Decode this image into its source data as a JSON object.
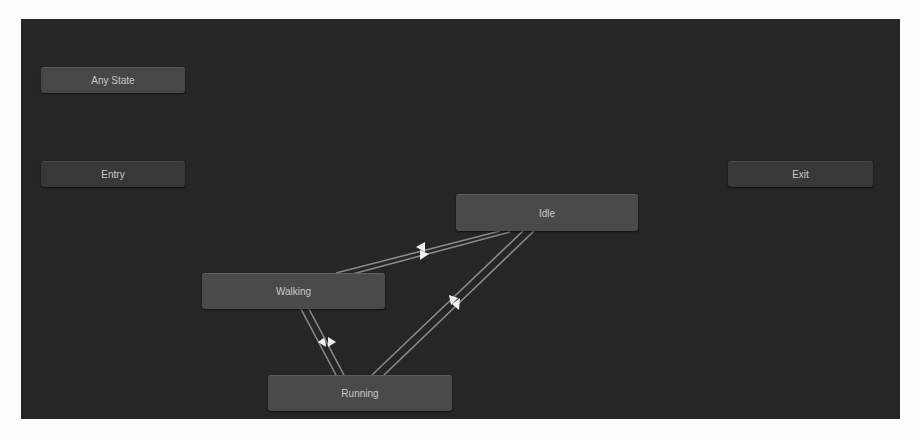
{
  "window": {
    "panel_bg": "#262626",
    "page_bg": "#fdfdfd"
  },
  "nodes": {
    "any_state": {
      "label": "Any State",
      "x": 41,
      "y": 67,
      "w": 144,
      "h": 26
    },
    "entry": {
      "label": "Entry",
      "x": 41,
      "y": 161,
      "w": 144,
      "h": 26
    },
    "exit": {
      "label": "Exit",
      "x": 728,
      "y": 161,
      "w": 145,
      "h": 26
    },
    "idle": {
      "label": "Idle",
      "x": 456,
      "y": 194,
      "w": 182,
      "h": 37
    },
    "walking": {
      "label": "Walking",
      "x": 202,
      "y": 273,
      "w": 183,
      "h": 36
    },
    "running": {
      "label": "Running",
      "x": 268,
      "y": 375,
      "w": 184,
      "h": 36
    }
  },
  "transitions": [
    {
      "from": "Idle",
      "to": "Walking",
      "line_color": "#8a8a8a",
      "arrow_color": "#f0f0f0"
    },
    {
      "from": "Walking",
      "to": "Idle",
      "line_color": "#8a8a8a",
      "arrow_color": "#f0f0f0"
    },
    {
      "from": "Idle",
      "to": "Running",
      "line_color": "#8a8a8a",
      "arrow_color": "#f0f0f0"
    },
    {
      "from": "Running",
      "to": "Idle",
      "line_color": "#8a8a8a",
      "arrow_color": "#f0f0f0"
    },
    {
      "from": "Walking",
      "to": "Running",
      "line_color": "#8a8a8a",
      "arrow_color": "#f0f0f0"
    },
    {
      "from": "Running",
      "to": "Walking",
      "line_color": "#8a8a8a",
      "arrow_color": "#f0f0f0"
    }
  ]
}
